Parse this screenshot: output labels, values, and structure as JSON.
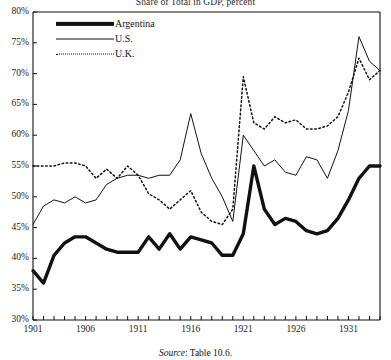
{
  "title": "Share of Total in GDP, percent",
  "source": {
    "prefix": "Source",
    "text": ": Table 10.6."
  },
  "legend": {
    "position": "top-left-inside",
    "items": [
      {
        "label": "Argentina",
        "style": "thick-solid",
        "color": "#111111"
      },
      {
        "label": "U.S.",
        "style": "thin-solid",
        "color": "#111111"
      },
      {
        "label": "U.K.",
        "style": "dotted",
        "color": "#111111"
      }
    ]
  },
  "axes": {
    "y_ticks": [
      "30%",
      "35%",
      "40%",
      "45%",
      "50%",
      "55%",
      "60%",
      "65%",
      "70%",
      "75%",
      "80%"
    ],
    "x_ticks": [
      "1901",
      "1906",
      "1911",
      "1916",
      "1921",
      "1926",
      "1931"
    ]
  },
  "chart_data": {
    "type": "line",
    "title": "Share of Total in GDP, percent",
    "xlabel": "",
    "ylabel": "",
    "xlim": [
      1901,
      1934
    ],
    "ylim": [
      30,
      80
    ],
    "ytick_format": "percent",
    "ytick_values": [
      30,
      35,
      40,
      45,
      50,
      55,
      60,
      65,
      70,
      75,
      80
    ],
    "xtick_labeled": [
      1901,
      1906,
      1911,
      1916,
      1921,
      1926,
      1931
    ],
    "xtick_minor_every": 1,
    "grid": false,
    "legend_position": "upper left",
    "x": [
      1901,
      1902,
      1903,
      1904,
      1905,
      1906,
      1907,
      1908,
      1909,
      1910,
      1911,
      1912,
      1913,
      1914,
      1915,
      1916,
      1917,
      1918,
      1919,
      1920,
      1921,
      1922,
      1923,
      1924,
      1925,
      1926,
      1927,
      1928,
      1929,
      1930,
      1931,
      1932,
      1933,
      1934
    ],
    "series": [
      {
        "name": "Argentina",
        "style": "thick-solid",
        "color": "#111111",
        "values": [
          38.0,
          36.0,
          40.5,
          42.5,
          43.5,
          43.5,
          42.5,
          41.5,
          41.0,
          41.0,
          41.0,
          43.5,
          41.5,
          44.0,
          41.5,
          43.5,
          43.0,
          42.5,
          40.5,
          40.5,
          44.0,
          55.0,
          48.0,
          45.5,
          46.5,
          46.0,
          44.5,
          44.0,
          44.5,
          46.5,
          49.5,
          53.0,
          55.0,
          55.0
        ]
      },
      {
        "name": "U.S.",
        "style": "thin-solid",
        "color": "#111111",
        "values": [
          45.5,
          48.5,
          49.5,
          49.0,
          50.0,
          49.0,
          49.5,
          52.0,
          53.0,
          53.5,
          53.5,
          53.0,
          53.5,
          53.5,
          56.0,
          63.5,
          57.0,
          53.0,
          50.0,
          46.0,
          60.0,
          57.5,
          55.0,
          56.0,
          54.0,
          53.5,
          56.5,
          56.0,
          53.0,
          57.5,
          64.0,
          76.0,
          72.0,
          70.5
        ]
      },
      {
        "name": "U.K.",
        "style": "dotted",
        "color": "#111111",
        "values": [
          55.0,
          55.0,
          55.0,
          55.5,
          55.5,
          55.0,
          53.0,
          54.5,
          53.0,
          55.0,
          53.5,
          50.5,
          49.5,
          48.0,
          49.5,
          51.0,
          47.5,
          46.0,
          45.5,
          48.0,
          69.5,
          62.0,
          61.0,
          63.0,
          62.0,
          62.5,
          61.0,
          61.0,
          61.5,
          63.0,
          67.0,
          72.5,
          69.0,
          70.5
        ]
      }
    ]
  }
}
